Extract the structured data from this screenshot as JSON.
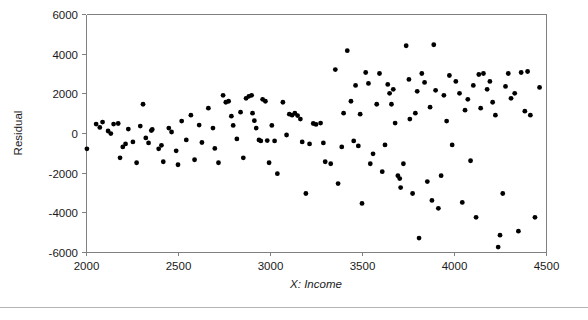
{
  "chart_data": {
    "type": "scatter",
    "title": "",
    "xlabel": "X: Income",
    "ylabel": "Residual",
    "xlim": [
      2000,
      4500
    ],
    "ylim": [
      -6000,
      6000
    ],
    "grid": false,
    "legend": null,
    "xticks": [
      2000,
      2500,
      3000,
      3500,
      4000,
      4500
    ],
    "xtick_labels": [
      "2000",
      "2500",
      "3000",
      "3500",
      "4000",
      "4500"
    ],
    "yticks": [
      -6000,
      -4000,
      -2000,
      0,
      2000,
      4000,
      6000
    ],
    "ytick_labels": [
      "-6000",
      "-4000",
      "-2000",
      "0",
      "2000",
      "4000",
      "6000"
    ],
    "marker": "filled-circle",
    "marker_color": "#000000",
    "marker_size": 3,
    "series": [
      {
        "name": "Residuals vs Income",
        "points": [
          [
            2005,
            -800
          ],
          [
            2055,
            450
          ],
          [
            2075,
            280
          ],
          [
            2090,
            550
          ],
          [
            2120,
            100
          ],
          [
            2135,
            -30
          ],
          [
            2150,
            450
          ],
          [
            2175,
            480
          ],
          [
            2185,
            -1250
          ],
          [
            2200,
            -700
          ],
          [
            2215,
            -550
          ],
          [
            2230,
            200
          ],
          [
            2255,
            -450
          ],
          [
            2275,
            -1500
          ],
          [
            2295,
            350
          ],
          [
            2310,
            1450
          ],
          [
            2325,
            -250
          ],
          [
            2340,
            -500
          ],
          [
            2355,
            120
          ],
          [
            2360,
            180
          ],
          [
            2395,
            -800
          ],
          [
            2410,
            -620
          ],
          [
            2420,
            -1450
          ],
          [
            2450,
            250
          ],
          [
            2465,
            50
          ],
          [
            2490,
            -900
          ],
          [
            2500,
            -1600
          ],
          [
            2520,
            600
          ],
          [
            2545,
            -350
          ],
          [
            2570,
            900
          ],
          [
            2590,
            -1350
          ],
          [
            2615,
            400
          ],
          [
            2630,
            -480
          ],
          [
            2665,
            1250
          ],
          [
            2690,
            250
          ],
          [
            2700,
            -780
          ],
          [
            2720,
            -1500
          ],
          [
            2745,
            1900
          ],
          [
            2760,
            1550
          ],
          [
            2775,
            1600
          ],
          [
            2790,
            850
          ],
          [
            2800,
            380
          ],
          [
            2820,
            -300
          ],
          [
            2840,
            1050
          ],
          [
            2855,
            -1250
          ],
          [
            2870,
            1750
          ],
          [
            2885,
            1850
          ],
          [
            2900,
            1900
          ],
          [
            2905,
            1000
          ],
          [
            2915,
            620
          ],
          [
            2925,
            250
          ],
          [
            2940,
            -350
          ],
          [
            2950,
            -400
          ],
          [
            2960,
            1700
          ],
          [
            2975,
            1600
          ],
          [
            2985,
            -380
          ],
          [
            2995,
            -1500
          ],
          [
            3010,
            380
          ],
          [
            3025,
            -400
          ],
          [
            3040,
            -2050
          ],
          [
            3070,
            1550
          ],
          [
            3090,
            -100
          ],
          [
            3105,
            950
          ],
          [
            3120,
            900
          ],
          [
            3135,
            1000
          ],
          [
            3150,
            880
          ],
          [
            3165,
            700
          ],
          [
            3175,
            -450
          ],
          [
            3195,
            -3050
          ],
          [
            3215,
            -550
          ],
          [
            3235,
            480
          ],
          [
            3250,
            430
          ],
          [
            3275,
            500
          ],
          [
            3290,
            -500
          ],
          [
            3300,
            -1450
          ],
          [
            3330,
            -1550
          ],
          [
            3355,
            3200
          ],
          [
            3370,
            -2550
          ],
          [
            3390,
            -700
          ],
          [
            3400,
            1000
          ],
          [
            3420,
            4150
          ],
          [
            3440,
            1600
          ],
          [
            3455,
            -400
          ],
          [
            3465,
            2400
          ],
          [
            3480,
            -650
          ],
          [
            3490,
            950
          ],
          [
            3500,
            -3550
          ],
          [
            3520,
            3050
          ],
          [
            3535,
            2500
          ],
          [
            3545,
            -1550
          ],
          [
            3560,
            -1050
          ],
          [
            3580,
            1450
          ],
          [
            3595,
            3000
          ],
          [
            3610,
            -1950
          ],
          [
            3625,
            -600
          ],
          [
            3640,
            2450
          ],
          [
            3650,
            2000
          ],
          [
            3660,
            1450
          ],
          [
            3670,
            2200
          ],
          [
            3680,
            500
          ],
          [
            3695,
            -2150
          ],
          [
            3705,
            -2300
          ],
          [
            3710,
            -2750
          ],
          [
            3725,
            -1550
          ],
          [
            3740,
            4400
          ],
          [
            3755,
            2700
          ],
          [
            3760,
            700
          ],
          [
            3775,
            -3050
          ],
          [
            3790,
            1000
          ],
          [
            3800,
            2100
          ],
          [
            3810,
            -5300
          ],
          [
            3825,
            3000
          ],
          [
            3840,
            2550
          ],
          [
            3855,
            -2450
          ],
          [
            3870,
            1300
          ],
          [
            3880,
            -3400
          ],
          [
            3890,
            4450
          ],
          [
            3900,
            2150
          ],
          [
            3915,
            -3800
          ],
          [
            3930,
            -2150
          ],
          [
            3945,
            1900
          ],
          [
            3960,
            600
          ],
          [
            3975,
            2900
          ],
          [
            3990,
            -600
          ],
          [
            4010,
            2600
          ],
          [
            4030,
            2000
          ],
          [
            4045,
            -3500
          ],
          [
            4060,
            1150
          ],
          [
            4075,
            1700
          ],
          [
            4090,
            -1400
          ],
          [
            4105,
            2400
          ],
          [
            4120,
            -4250
          ],
          [
            4135,
            2950
          ],
          [
            4145,
            1250
          ],
          [
            4160,
            3000
          ],
          [
            4180,
            2200
          ],
          [
            4195,
            2600
          ],
          [
            4210,
            1550
          ],
          [
            4225,
            900
          ],
          [
            4240,
            -5750
          ],
          [
            4250,
            -5150
          ],
          [
            4265,
            -3050
          ],
          [
            4280,
            2350
          ],
          [
            4295,
            3000
          ],
          [
            4310,
            1750
          ],
          [
            4330,
            2000
          ],
          [
            4350,
            -4950
          ],
          [
            4365,
            3050
          ],
          [
            4385,
            1100
          ],
          [
            4400,
            3100
          ],
          [
            4415,
            900
          ],
          [
            4440,
            -4250
          ],
          [
            4465,
            2300
          ]
        ]
      }
    ]
  },
  "figure": {
    "plot_left_px": 86,
    "plot_right_px": 546,
    "plot_top_px": 14,
    "plot_bottom_px": 252,
    "frame_color": "#808080",
    "separator_color": "#b4b4b4",
    "background": "#ffffff"
  }
}
